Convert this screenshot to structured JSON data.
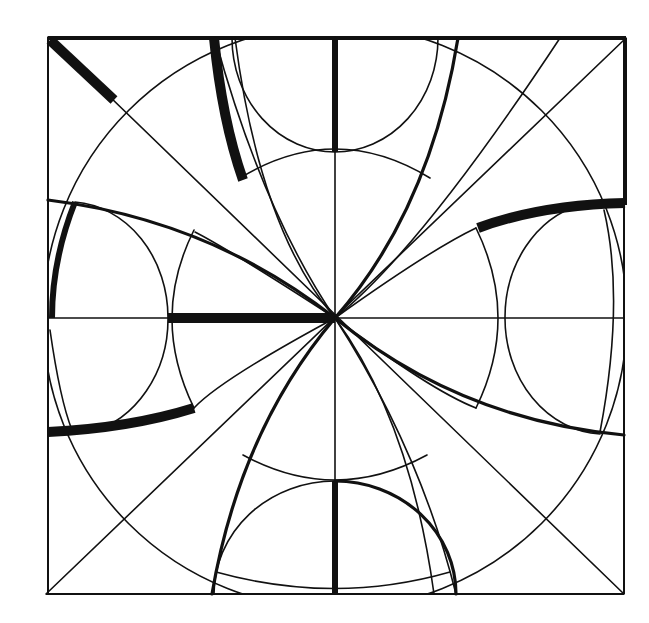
{
  "diagram": {
    "background": "#ffffff",
    "stroke_color": "#111111",
    "square": {
      "x1": 48,
      "y1": 37,
      "x2": 624,
      "y2": 594
    },
    "center": {
      "x": 335,
      "y": 317
    },
    "elements": [
      "outer-square",
      "diagonals",
      "center-cross",
      "large-circle",
      "top-semicircle",
      "bottom-semicircle",
      "left-semicircle",
      "right-semicircle",
      "pointed-arcs",
      "highlighted-thick-segments"
    ]
  }
}
